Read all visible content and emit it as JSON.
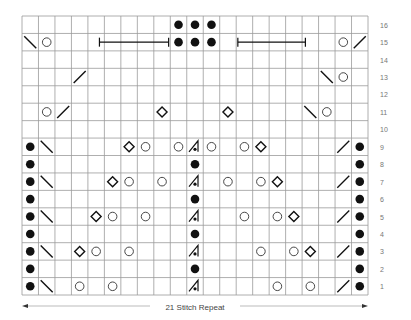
{
  "chart_data": {
    "type": "knitting-chart",
    "title": "",
    "columns": 21,
    "rows": 16,
    "row_labels": [
      "1",
      "2",
      "3",
      "4",
      "5",
      "6",
      "7",
      "8",
      "9",
      "10",
      "11",
      "12",
      "13",
      "14",
      "15",
      "16"
    ],
    "repeat_label": "21 Stitch Repeat",
    "symbols": {
      "purl": "filled dot",
      "yo": "open circle",
      "k2tog": "right-leaning slash /",
      "ssk": "left-leaning slash \\",
      "nupp_or_bobble": "diamond",
      "sk2p": "centered double decrease (triangle with dot)",
      "bracket": "horizontal bar spanning stitches"
    },
    "cells": [
      {
        "row": 16,
        "col": 10,
        "sym": "purl"
      },
      {
        "row": 16,
        "col": 11,
        "sym": "purl"
      },
      {
        "row": 16,
        "col": 12,
        "sym": "purl"
      },
      {
        "row": 15,
        "col": 1,
        "sym": "ssk"
      },
      {
        "row": 15,
        "col": 2,
        "sym": "yo"
      },
      {
        "row": 15,
        "col": 10,
        "sym": "purl"
      },
      {
        "row": 15,
        "col": 11,
        "sym": "purl"
      },
      {
        "row": 15,
        "col": 12,
        "sym": "purl"
      },
      {
        "row": 15,
        "col": 20,
        "sym": "yo"
      },
      {
        "row": 15,
        "col": 21,
        "sym": "k2tog"
      },
      {
        "row": 13,
        "col": 4,
        "sym": "k2tog"
      },
      {
        "row": 13,
        "col": 19,
        "sym": "ssk"
      },
      {
        "row": 13,
        "col": 20,
        "sym": "yo"
      },
      {
        "row": 11,
        "col": 2,
        "sym": "yo"
      },
      {
        "row": 11,
        "col": 3,
        "sym": "k2tog"
      },
      {
        "row": 11,
        "col": 9,
        "sym": "nupp_or_bobble"
      },
      {
        "row": 11,
        "col": 13,
        "sym": "nupp_or_bobble"
      },
      {
        "row": 11,
        "col": 18,
        "sym": "ssk"
      },
      {
        "row": 11,
        "col": 19,
        "sym": "yo"
      },
      {
        "row": 9,
        "col": 1,
        "sym": "purl"
      },
      {
        "row": 9,
        "col": 2,
        "sym": "ssk"
      },
      {
        "row": 9,
        "col": 7,
        "sym": "nupp_or_bobble"
      },
      {
        "row": 9,
        "col": 8,
        "sym": "yo"
      },
      {
        "row": 9,
        "col": 10,
        "sym": "yo"
      },
      {
        "row": 9,
        "col": 11,
        "sym": "sk2p"
      },
      {
        "row": 9,
        "col": 12,
        "sym": "yo"
      },
      {
        "row": 9,
        "col": 14,
        "sym": "yo"
      },
      {
        "row": 9,
        "col": 15,
        "sym": "nupp_or_bobble"
      },
      {
        "row": 9,
        "col": 20,
        "sym": "k2tog"
      },
      {
        "row": 9,
        "col": 21,
        "sym": "purl"
      },
      {
        "row": 8,
        "col": 1,
        "sym": "purl"
      },
      {
        "row": 8,
        "col": 11,
        "sym": "purl"
      },
      {
        "row": 8,
        "col": 21,
        "sym": "purl"
      },
      {
        "row": 7,
        "col": 1,
        "sym": "purl"
      },
      {
        "row": 7,
        "col": 2,
        "sym": "ssk"
      },
      {
        "row": 7,
        "col": 6,
        "sym": "nupp_or_bobble"
      },
      {
        "row": 7,
        "col": 7,
        "sym": "yo"
      },
      {
        "row": 7,
        "col": 9,
        "sym": "yo"
      },
      {
        "row": 7,
        "col": 11,
        "sym": "sk2p"
      },
      {
        "row": 7,
        "col": 13,
        "sym": "yo"
      },
      {
        "row": 7,
        "col": 15,
        "sym": "yo"
      },
      {
        "row": 7,
        "col": 16,
        "sym": "nupp_or_bobble"
      },
      {
        "row": 7,
        "col": 20,
        "sym": "k2tog"
      },
      {
        "row": 7,
        "col": 21,
        "sym": "purl"
      },
      {
        "row": 6,
        "col": 1,
        "sym": "purl"
      },
      {
        "row": 6,
        "col": 11,
        "sym": "purl"
      },
      {
        "row": 6,
        "col": 21,
        "sym": "purl"
      },
      {
        "row": 5,
        "col": 1,
        "sym": "purl"
      },
      {
        "row": 5,
        "col": 2,
        "sym": "ssk"
      },
      {
        "row": 5,
        "col": 5,
        "sym": "nupp_or_bobble"
      },
      {
        "row": 5,
        "col": 6,
        "sym": "yo"
      },
      {
        "row": 5,
        "col": 8,
        "sym": "yo"
      },
      {
        "row": 5,
        "col": 11,
        "sym": "sk2p"
      },
      {
        "row": 5,
        "col": 14,
        "sym": "yo"
      },
      {
        "row": 5,
        "col": 16,
        "sym": "yo"
      },
      {
        "row": 5,
        "col": 17,
        "sym": "nupp_or_bobble"
      },
      {
        "row": 5,
        "col": 20,
        "sym": "k2tog"
      },
      {
        "row": 5,
        "col": 21,
        "sym": "purl"
      },
      {
        "row": 4,
        "col": 1,
        "sym": "purl"
      },
      {
        "row": 4,
        "col": 11,
        "sym": "purl"
      },
      {
        "row": 4,
        "col": 21,
        "sym": "purl"
      },
      {
        "row": 3,
        "col": 1,
        "sym": "purl"
      },
      {
        "row": 3,
        "col": 2,
        "sym": "ssk"
      },
      {
        "row": 3,
        "col": 4,
        "sym": "nupp_or_bobble"
      },
      {
        "row": 3,
        "col": 5,
        "sym": "yo"
      },
      {
        "row": 3,
        "col": 7,
        "sym": "yo"
      },
      {
        "row": 3,
        "col": 11,
        "sym": "sk2p"
      },
      {
        "row": 3,
        "col": 15,
        "sym": "yo"
      },
      {
        "row": 3,
        "col": 17,
        "sym": "yo"
      },
      {
        "row": 3,
        "col": 18,
        "sym": "nupp_or_bobble"
      },
      {
        "row": 3,
        "col": 20,
        "sym": "k2tog"
      },
      {
        "row": 3,
        "col": 21,
        "sym": "purl"
      },
      {
        "row": 2,
        "col": 1,
        "sym": "purl"
      },
      {
        "row": 2,
        "col": 11,
        "sym": "purl"
      },
      {
        "row": 2,
        "col": 21,
        "sym": "purl"
      },
      {
        "row": 1,
        "col": 1,
        "sym": "purl"
      },
      {
        "row": 1,
        "col": 2,
        "sym": "ssk"
      },
      {
        "row": 1,
        "col": 4,
        "sym": "yo"
      },
      {
        "row": 1,
        "col": 6,
        "sym": "yo"
      },
      {
        "row": 1,
        "col": 11,
        "sym": "sk2p"
      },
      {
        "row": 1,
        "col": 16,
        "sym": "yo"
      },
      {
        "row": 1,
        "col": 18,
        "sym": "yo"
      },
      {
        "row": 1,
        "col": 20,
        "sym": "k2tog"
      },
      {
        "row": 1,
        "col": 21,
        "sym": "purl"
      }
    ],
    "brackets": [
      {
        "row": 15,
        "from_col": 4.7,
        "to_col": 8.9
      },
      {
        "row": 15,
        "from_col": 13.1,
        "to_col": 17.2
      }
    ]
  },
  "colors": {
    "grid_line": "#9a9a9a",
    "ink": "#111111",
    "label": "#777777",
    "repeat_line": "#bbbbbb"
  }
}
